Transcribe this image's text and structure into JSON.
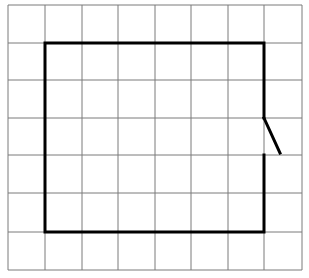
{
  "diagram": {
    "type": "grid-figure",
    "grid": {
      "columns": 8,
      "rows": 7,
      "x_lines": [
        8,
        45,
        82,
        118,
        155,
        191,
        228,
        264,
        302
      ],
      "y_lines": [
        5,
        43,
        80,
        118,
        155,
        193,
        232,
        270
      ],
      "line_color": "#7a7a7a"
    },
    "figure": {
      "description": "Bold rectangle outline with an opening on the right side, where a short diagonal segment swings outward like a door",
      "stroke_color": "#000000",
      "outline_points": "264,118 264,43 45,43 45,232 264,232 264,155",
      "door_segment": {
        "x1": 264,
        "y1": 118,
        "x2": 280,
        "y2": 153
      }
    }
  }
}
